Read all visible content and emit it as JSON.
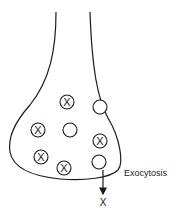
{
  "diagram": {
    "label": "Exocytosis",
    "vesicle_marker": "X",
    "released_marker": "X",
    "line_color": "#1a1a1a",
    "vesicles": [
      {
        "x": 67,
        "y": 102,
        "filled": true
      },
      {
        "x": 100,
        "y": 107,
        "filled": false
      },
      {
        "x": 38,
        "y": 130,
        "filled": true
      },
      {
        "x": 70,
        "y": 130,
        "filled": false
      },
      {
        "x": 100,
        "y": 141,
        "filled": true
      },
      {
        "x": 41,
        "y": 157,
        "filled": true
      },
      {
        "x": 64,
        "y": 168,
        "filled": true
      },
      {
        "x": 99,
        "y": 162,
        "filled": false
      }
    ]
  }
}
